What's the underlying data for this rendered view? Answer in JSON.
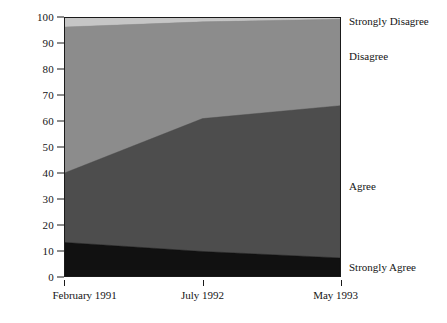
{
  "chart_data": {
    "type": "area",
    "title": "",
    "subtitle": "",
    "xlabel": "",
    "ylabel": "",
    "stacked": true,
    "percent": true,
    "grid": false,
    "legend_position": "right-inline",
    "x": [
      "February 1991",
      "July 1992",
      "May 1993"
    ],
    "xtick_labels": [
      "February 1991",
      "July 1992",
      "May 1993"
    ],
    "ylim": [
      0,
      100
    ],
    "ytick_labels": [
      "0",
      "10",
      "20",
      "30",
      "40",
      "50",
      "60",
      "70",
      "80",
      "90",
      "100"
    ],
    "ytick_values": [
      0,
      10,
      20,
      30,
      40,
      50,
      60,
      70,
      80,
      90,
      100
    ],
    "series": [
      {
        "name": "Strongly Agree",
        "values": [
          13,
          9.5,
          7
        ],
        "color": "#111111"
      },
      {
        "name": "Agree",
        "values": [
          27,
          51.5,
          59
        ],
        "color": "#4d4d4d"
      },
      {
        "name": "Disagree",
        "values": [
          56.5,
          37.5,
          33.5
        ],
        "color": "#8c8c8c"
      },
      {
        "name": "Strongly Disagree",
        "values": [
          3.5,
          1.5,
          0.5
        ],
        "color": "#c6c6c6"
      }
    ],
    "cumulative_tops": {
      "strongly_agree": [
        13,
        9.5,
        7
      ],
      "agree": [
        40,
        61,
        66
      ],
      "disagree": [
        96.5,
        98.5,
        99.5
      ],
      "strongly_disagree": [
        100,
        100,
        100
      ]
    },
    "legend_entries": [
      {
        "label": "Strongly Disagree",
        "value_at_pct": 98.5
      },
      {
        "label": "Disagree",
        "value_at_pct": 85
      },
      {
        "label": "Agree",
        "value_at_pct": 35
      },
      {
        "label": "Strongly Agree",
        "value_at_pct": 4
      }
    ],
    "colors": {
      "strongly_agree": "#111111",
      "agree": "#4d4d4d",
      "disagree": "#8c8c8c",
      "strongly_disagree": "#c6c6c6",
      "axis": "#1a1a1a",
      "background": "#ffffff"
    }
  }
}
